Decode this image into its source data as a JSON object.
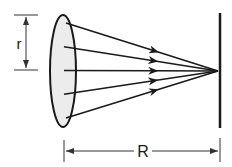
{
  "diagram": {
    "labels": {
      "radius": "r",
      "distance": "R"
    },
    "ray_count": 5,
    "colors": {
      "stroke": "#1a1a1a",
      "aperture_fill": "#ececec",
      "dimension_line": "#333333"
    }
  }
}
